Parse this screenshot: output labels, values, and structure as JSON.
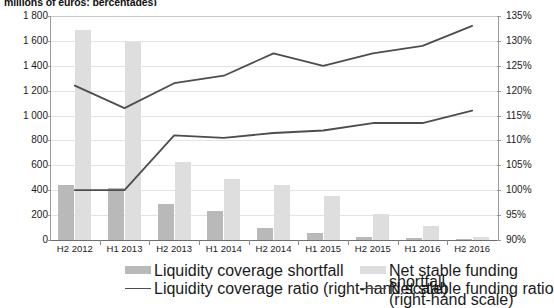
{
  "subtitle": "millions of euros; percentages)",
  "axes": {
    "left_ticks": [
      "1 800",
      "1 600",
      "1 400",
      "1 200",
      "1 000",
      "800",
      "600",
      "400",
      "200",
      "0"
    ],
    "right_ticks": [
      "135%",
      "130%",
      "125%",
      "120%",
      "115%",
      "110%",
      "105%",
      "100%",
      "95%",
      "90%"
    ],
    "left_min": 0,
    "left_max": 1800,
    "right_min": 90,
    "right_max": 135
  },
  "legend": {
    "items": [
      {
        "label": "Liquidity coverage shortfall",
        "type": "bar",
        "color": "#b9b9b9"
      },
      {
        "label": "Net stable funding shortfall",
        "type": "bar",
        "color": "#dedede"
      },
      {
        "label": "Liquidity coverage ratio (right-hand scale)",
        "type": "line",
        "color": "#4d4d4d"
      },
      {
        "label": "Net stable funding ratio (right-hand scale)",
        "type": "line",
        "color": "#4d4d4d"
      }
    ]
  },
  "chart_data": {
    "type": "bar",
    "title": "",
    "subtitle": "millions of euros; percentages)",
    "xlabel": "",
    "ylabel": "",
    "categories": [
      "H2 2012",
      "H1 2013",
      "H2 2013",
      "H1 2014",
      "H2 2014",
      "H1 2015",
      "H2 2015",
      "H1 2016",
      "H2 2016"
    ],
    "ylim": [
      0,
      1800
    ],
    "y2lim": [
      90,
      135
    ],
    "grid": true,
    "legend_position": "bottom",
    "series": [
      {
        "name": "Liquidity coverage shortfall",
        "type": "bar",
        "axis": "left",
        "color": "#b9b9b9",
        "values": [
          440,
          415,
          290,
          235,
          95,
          55,
          25,
          20,
          10
        ]
      },
      {
        "name": "Net stable funding shortfall",
        "type": "bar",
        "axis": "left",
        "color": "#dedede",
        "values": [
          1690,
          1590,
          630,
          490,
          440,
          350,
          205,
          115,
          25
        ]
      },
      {
        "name": "Liquidity coverage ratio (right-hand scale)",
        "type": "line",
        "axis": "right",
        "color": "#4d4d4d",
        "values": [
          121.0,
          116.5,
          121.5,
          123.0,
          127.5,
          125.0,
          127.5,
          129.0,
          133.0
        ]
      },
      {
        "name": "Net stable funding ratio (right-hand scale)",
        "type": "line",
        "axis": "right",
        "color": "#4d4d4d",
        "values": [
          100.0,
          100.0,
          111.0,
          110.5,
          111.5,
          112.0,
          113.5,
          113.5,
          116.0
        ]
      }
    ]
  }
}
